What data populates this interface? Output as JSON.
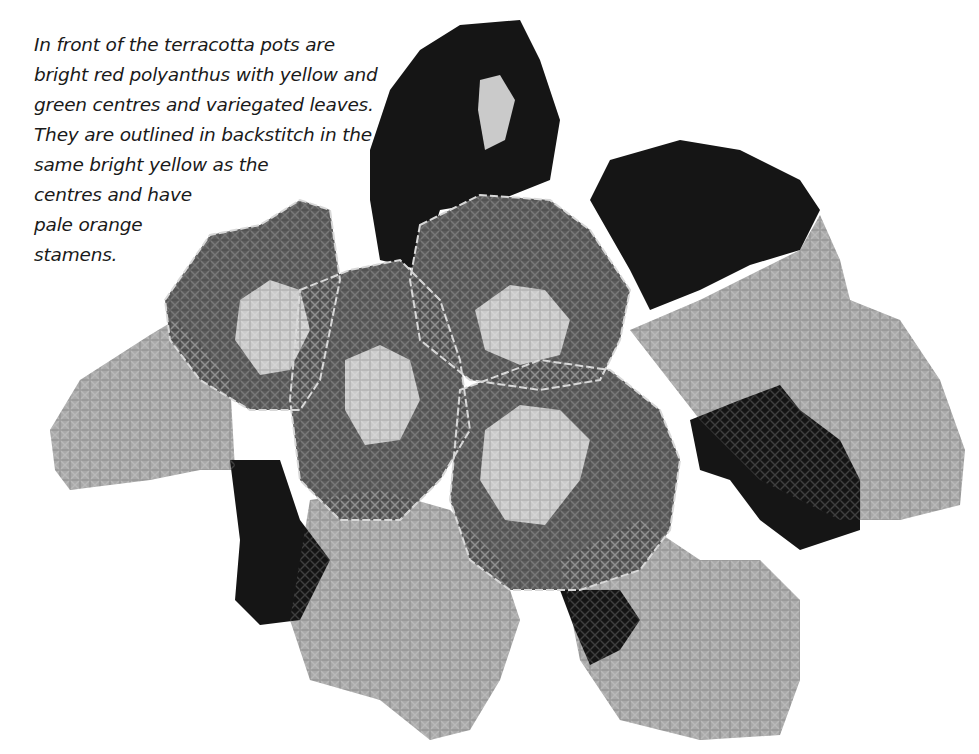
{
  "caption": {
    "lines": [
      "In front of the terracotta pots are",
      "bright red polyanthus with yellow and",
      "green centres and variegated leaves.",
      "They are outlined in backstitch in the",
      "same bright yellow as the",
      "centres and have",
      "pale orange",
      "stamens."
    ]
  },
  "illustration": {
    "subject": "cross-stitch polyanthus flowers with variegated leaves",
    "colors": {
      "dark_leaf": "#161616",
      "petal_red": "#5a5a5a",
      "pale_leaf": "#a8a8a8",
      "centre": "#c8c8c8",
      "backstitch": "#d6d6d6"
    }
  }
}
